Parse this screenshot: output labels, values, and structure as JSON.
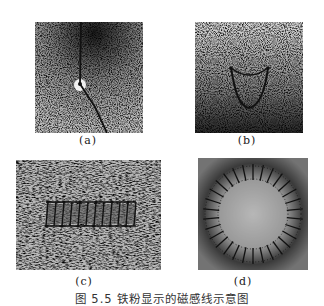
{
  "figure": {
    "caption": "图 5.5   铁粉显示的磁感线示意图",
    "panels": [
      {
        "id": "a",
        "label": "(a)",
        "subject": "straight current-carrying wire through plate"
      },
      {
        "id": "b",
        "label": "(b)",
        "subject": "single circular current loop"
      },
      {
        "id": "c",
        "label": "(c)",
        "subject": "straight solenoid"
      },
      {
        "id": "d",
        "label": "(d)",
        "subject": "toroidal (ring) solenoid"
      }
    ]
  },
  "colors": {
    "background": "#ffffff",
    "filings": "#222222",
    "wire": "#111111"
  }
}
